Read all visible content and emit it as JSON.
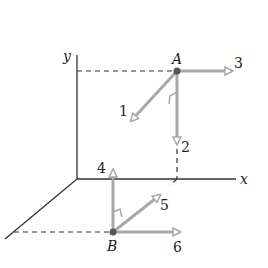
{
  "axes": {
    "y_label": "y",
    "x_label": "x"
  },
  "points": {
    "A": "A",
    "B": "B"
  },
  "vectors": {
    "v1": "1",
    "v2": "2",
    "v3": "3",
    "v4": "4",
    "v5": "5",
    "v6": "6"
  },
  "colors": {
    "arrow": "#a8a8a8",
    "axis": "#333333",
    "point": "#555555"
  }
}
